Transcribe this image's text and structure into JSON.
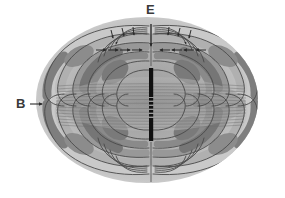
{
  "diagram": {
    "type": "physics-field-diagram",
    "background_color": "#ffffff",
    "canvas": {
      "width": 285,
      "height": 198
    },
    "labels": {
      "electric_field": {
        "text": "E",
        "meaning": "electric field",
        "position": {
          "x": 152,
          "y": 12
        },
        "color": "#3a3a3a"
      },
      "magnetic_field": {
        "text": "B",
        "meaning": "magnetic field",
        "position": {
          "x": 22,
          "y": 104
        },
        "color": "#3a3a3a"
      }
    },
    "antenna": {
      "name": "dipole-antenna",
      "orientation": "vertical",
      "center": {
        "x": 151,
        "y": 104
      },
      "top_segment": {
        "y_start": 68,
        "y_end": 97
      },
      "gap_segment": {
        "y_start": 97,
        "y_end": 118,
        "style": "dashed"
      },
      "bottom_segment": {
        "y_start": 118,
        "y_end": 141
      },
      "width": 4,
      "color": "#111111"
    },
    "envelope": {
      "name": "radiation-envelope",
      "center": {
        "x": 147,
        "y": 100
      },
      "radius_x": 111,
      "radius_y": 83,
      "fill_light": "#d2d2d2",
      "fill_mid": "#a8a8a8",
      "fill_dark": "#7a7a7a"
    },
    "axis": {
      "name": "dipole-axis",
      "x": 151,
      "top": 24,
      "bottom": 180,
      "color": "#555555"
    },
    "palette": {
      "line_dark": "#4a4a4a",
      "line_mid": "#6e6e6e",
      "lobe_dark": "#767676",
      "lobe_mid": "#969696",
      "band_light": "#c9c9c9",
      "band_pale": "#dcdcdc",
      "striation": "#8a8a8a",
      "arrow": "#2b2b2b",
      "label": "#3a3a3a"
    },
    "equatorial_band": {
      "name": "magnetic-striation-band",
      "y_center": 104,
      "half_height": 26,
      "x_start": 58,
      "x_end": 244,
      "line_count": 19,
      "description": "dense horizontal striations representing B field lines seen edge-on"
    },
    "arrows": {
      "top_row": {
        "count": 9,
        "y": 50,
        "direction": "inward-horizontal",
        "x_positions": [
          100,
          112,
          124,
          136,
          151,
          166,
          178,
          190,
          202
        ]
      },
      "upper_curve_row": {
        "count": 8,
        "y": 36,
        "direction": "down-inward",
        "x_positions": [
          111,
          122,
          133,
          143,
          159,
          170,
          181,
          192
        ]
      },
      "center_down_arrow": {
        "x": 151,
        "y_start": 26,
        "y_end": 44,
        "direction": "down"
      },
      "b_pointer": {
        "x_start": 30,
        "x_end": 42,
        "y": 104,
        "direction": "right"
      }
    },
    "field_lines": {
      "e_field": {
        "name": "electric-field-lines",
        "description": "closed curved loops emanating from the dipole, nested in four quadrant lobes",
        "loops_per_quadrant": 6
      },
      "b_field": {
        "name": "magnetic-field-lines",
        "description": "circular loops around the dipole axis, shown edge-on as horizontal striations"
      }
    }
  }
}
